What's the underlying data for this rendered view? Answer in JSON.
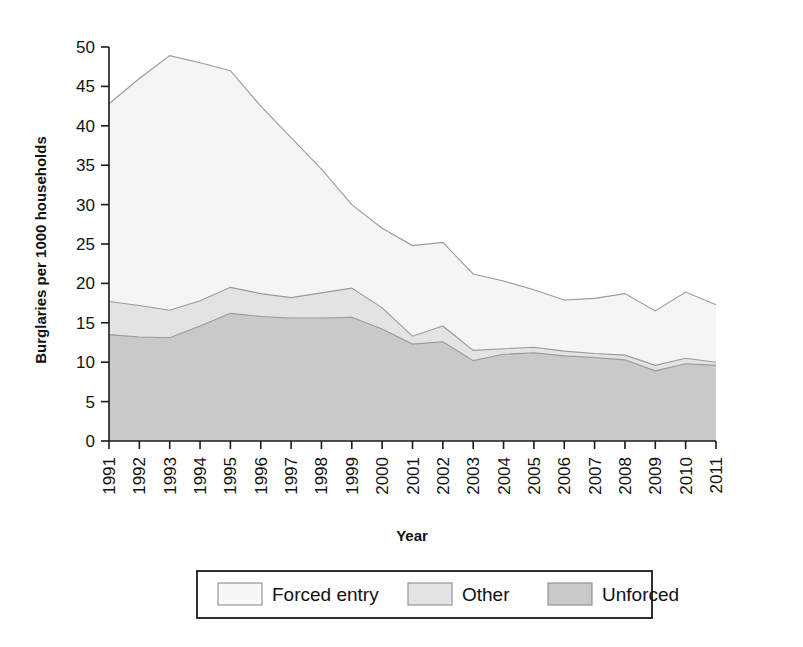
{
  "chart_data": {
    "type": "area",
    "stacked": true,
    "title": "",
    "xlabel": "Year",
    "ylabel": "Burglaries per 1000 households",
    "categories": [
      1991,
      1992,
      1993,
      1994,
      1995,
      1996,
      1997,
      1998,
      1999,
      2000,
      2001,
      2002,
      2003,
      2004,
      2005,
      2006,
      2007,
      2008,
      2009,
      2010,
      2011
    ],
    "xtick_labels": [
      "1991",
      "1992",
      "1993",
      "1994",
      "1995",
      "1996",
      "1997",
      "1998",
      "1999",
      "2000",
      "2001",
      "2002",
      "2003",
      "2004",
      "2005",
      "2006",
      "2007",
      "2008",
      "2009",
      "2010",
      "2011"
    ],
    "ytick_labels": [
      "0",
      "5",
      "10",
      "15",
      "20",
      "25",
      "30",
      "35",
      "40",
      "45",
      "50"
    ],
    "ytick_values": [
      0,
      5,
      10,
      15,
      20,
      25,
      30,
      35,
      40,
      45,
      50
    ],
    "ylim": [
      0,
      50
    ],
    "xlim": [
      1991,
      2011
    ],
    "grid": false,
    "legend_position": "bottom",
    "series": [
      {
        "name": "Unforced",
        "color": "#c9c9c9",
        "stack_order": 1,
        "values": [
          13.5,
          13.2,
          13.1,
          14.6,
          16.2,
          15.8,
          15.6,
          15.6,
          15.7,
          14.2,
          12.3,
          12.6,
          10.2,
          11.0,
          11.2,
          10.8,
          10.6,
          10.3,
          8.9,
          9.8,
          9.6
        ]
      },
      {
        "name": "Other",
        "color": "#e3e3e3",
        "stack_order": 2,
        "values": [
          4.2,
          4.0,
          3.5,
          3.2,
          3.3,
          2.9,
          2.6,
          3.2,
          3.7,
          2.7,
          1.0,
          2.0,
          1.3,
          0.7,
          0.7,
          0.6,
          0.5,
          0.6,
          0.7,
          0.7,
          0.4
        ]
      },
      {
        "name": "Forced entry",
        "color": "#f5f5f5",
        "stack_order": 3,
        "values": [
          25.1,
          28.8,
          32.3,
          30.2,
          27.5,
          23.8,
          20.3,
          15.7,
          10.6,
          10.1,
          11.5,
          10.6,
          9.7,
          8.6,
          7.3,
          6.5,
          7.0,
          7.8,
          6.9,
          8.4,
          7.3
        ]
      }
    ],
    "cumulative_totals": [
      42.8,
      46.0,
      48.9,
      48.0,
      47.0,
      42.5,
      38.5,
      34.5,
      30.0,
      27.0,
      24.8,
      25.2,
      21.2,
      20.3,
      19.2,
      17.9,
      18.1,
      18.7,
      16.5,
      18.9,
      17.3
    ],
    "cumulative_unforced_plus_other": [
      17.7,
      17.2,
      16.6,
      17.8,
      19.5,
      18.7,
      18.2,
      18.8,
      19.4,
      16.9,
      13.3,
      14.6,
      11.5,
      11.7,
      11.9,
      11.4,
      11.1,
      10.9,
      9.6,
      10.5,
      10.0
    ]
  },
  "legend": {
    "entries": [
      {
        "label": "Forced entry",
        "color": "#f7f7f7"
      },
      {
        "label": "Other",
        "color": "#e3e3e3"
      },
      {
        "label": "Unforced",
        "color": "#c9c9c9"
      }
    ]
  },
  "axes": {
    "y_title": "Burglaries per 1000 households",
    "x_title": "Year"
  }
}
